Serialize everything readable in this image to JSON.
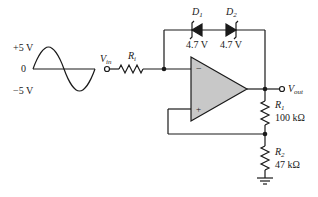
{
  "figure": {
    "type": "op-amp zener-limited inverting circuit with positive feedback",
    "colors": {
      "line": "#1a1a1a",
      "opamp_fill": "#c8c8c8"
    }
  },
  "input_signal": {
    "waveform": "sine",
    "labels": {
      "pos": "+5 V",
      "zero": "0",
      "neg": "−5 V"
    }
  },
  "vin": {
    "label_main": "V",
    "label_sub": "in"
  },
  "ri": {
    "label_main": "R",
    "label_sub": "i"
  },
  "d1": {
    "label_main": "D",
    "label_sub": "1",
    "rating": "4.7 V"
  },
  "d2": {
    "label_main": "D",
    "label_sub": "2",
    "rating": "4.7 V"
  },
  "opamp": {
    "inverting": "−",
    "noninverting": "+"
  },
  "vout": {
    "label_main": "V",
    "label_sub": "out"
  },
  "r1": {
    "label_main": "R",
    "label_sub": "1",
    "value": "100 kΩ"
  },
  "r2": {
    "label_main": "R",
    "label_sub": "2",
    "value": "47 kΩ"
  }
}
